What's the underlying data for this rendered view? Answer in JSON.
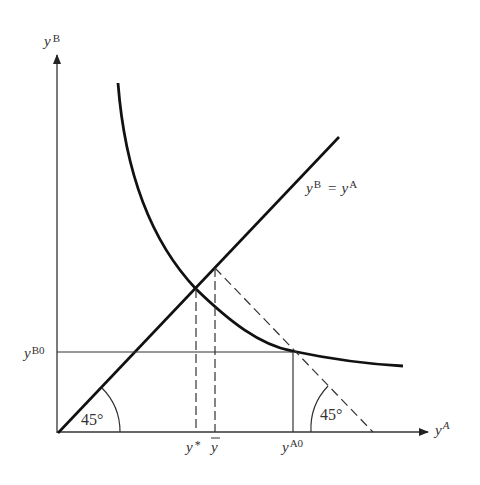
{
  "diagram": {
    "type": "economics-graph",
    "axes": {
      "y_label_base": "y",
      "y_label_sup": "B",
      "x_label_base": "y",
      "x_label_sup": "A"
    },
    "line_45": {
      "label_left": "y",
      "label_left_sup": "B",
      "label_eq": "=",
      "label_right": "y",
      "label_right_sup": "A"
    },
    "angles": [
      {
        "label": "45°",
        "position": "origin"
      },
      {
        "label": "45°",
        "position": "dashed-line-at-x-axis"
      }
    ],
    "y_ticks": [
      {
        "base": "y",
        "sup": "B0"
      }
    ],
    "x_ticks": [
      {
        "base": "y",
        "sup": "*",
        "name": "y-star"
      },
      {
        "base": "y",
        "overline": true,
        "name": "y-bar"
      },
      {
        "base": "y",
        "sup": "A0",
        "name": "y-A0"
      }
    ],
    "colors": {
      "line": "#111111",
      "axis": "#333333",
      "text": "#333333"
    }
  }
}
